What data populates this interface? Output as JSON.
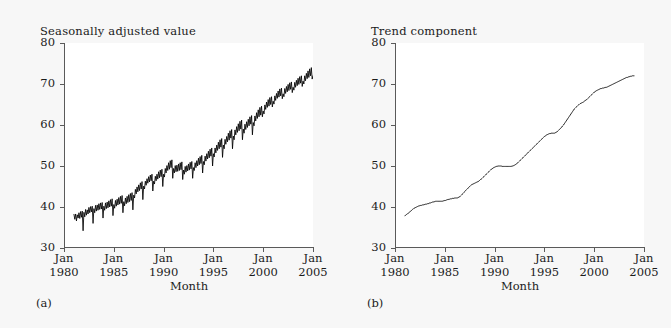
{
  "figure": {
    "background_color": "#f7f7f7",
    "plot_background_color": "#ffffff",
    "line_color": "#000000",
    "axis_color": "#5a5a5a"
  },
  "panels": [
    {
      "key": "a",
      "subfigure_label": "(a)",
      "title": "Seasonally adjusted value",
      "xlabel": "Month",
      "ytick_labels": [
        "80",
        "70",
        "60",
        "50",
        "40",
        "30"
      ],
      "xtick_labels": [
        {
          "month": "Jan",
          "year": "1980"
        },
        {
          "month": "Jan",
          "year": "1985"
        },
        {
          "month": "Jan",
          "year": "1990"
        },
        {
          "month": "Jan",
          "year": "1995"
        },
        {
          "month": "Jan",
          "year": "2000"
        },
        {
          "month": "Jan",
          "year": "2005"
        }
      ]
    },
    {
      "key": "b",
      "subfigure_label": "(b)",
      "title": "Trend component",
      "xlabel": "Month",
      "ytick_labels": [
        "80",
        "70",
        "60",
        "50",
        "40",
        "30"
      ],
      "xtick_labels": [
        {
          "month": "Jan",
          "year": "1980"
        },
        {
          "month": "Jan",
          "year": "1985"
        },
        {
          "month": "Jan",
          "year": "1990"
        },
        {
          "month": "Jan",
          "year": "1995"
        },
        {
          "month": "Jan",
          "year": "2000"
        },
        {
          "month": "Jan",
          "year": "2005"
        }
      ]
    }
  ],
  "chart_data": [
    {
      "type": "line",
      "title": "Seasonally adjusted value",
      "xlabel": "Month",
      "ylabel": "",
      "ylim": [
        30,
        80
      ],
      "yticks": [
        30,
        40,
        50,
        60,
        70,
        80
      ],
      "xlim": [
        "1981-01",
        "2004-01"
      ],
      "xticks": [
        "Jan 1980",
        "Jan 1985",
        "Jan 1990",
        "Jan 1995",
        "Jan 2000",
        "Jan 2005"
      ],
      "grid": false,
      "legend": "none",
      "x_start_year": 1981.0,
      "x_step_years": 0.0833333,
      "values": [
        38.2,
        37.0,
        38.3,
        36.6,
        38.1,
        37.3,
        38.6,
        37.2,
        38.9,
        37.5,
        39.0,
        34.2,
        38.7,
        37.6,
        39.4,
        38.0,
        39.3,
        38.3,
        39.9,
        38.6,
        40.1,
        38.8,
        40.2,
        36.0,
        39.6,
        38.6,
        40.4,
        39.0,
        40.5,
        39.2,
        40.8,
        39.4,
        41.0,
        39.5,
        41.1,
        37.3,
        40.2,
        39.2,
        41.0,
        39.6,
        41.2,
        39.8,
        41.5,
        40.0,
        41.8,
        40.2,
        42.0,
        37.9,
        40.6,
        39.7,
        41.6,
        40.2,
        41.9,
        40.5,
        42.3,
        40.7,
        42.6,
        40.9,
        42.8,
        38.6,
        41.3,
        40.3,
        42.2,
        40.8,
        42.6,
        41.1,
        43.0,
        41.3,
        43.3,
        41.6,
        43.5,
        39.3,
        42.9,
        42.2,
        44.3,
        43.2,
        44.9,
        43.7,
        45.4,
        44.0,
        45.9,
        44.4,
        46.2,
        41.8,
        45.1,
        44.4,
        46.3,
        45.3,
        46.9,
        45.8,
        47.4,
        46.1,
        47.8,
        46.4,
        48.0,
        43.9,
        46.3,
        45.6,
        47.5,
        46.4,
        48.0,
        46.8,
        48.6,
        47.1,
        49.0,
        47.4,
        49.2,
        45.0,
        48.0,
        47.3,
        49.4,
        48.3,
        50.1,
        48.9,
        50.8,
        49.2,
        51.3,
        49.6,
        51.5,
        47.0,
        49.4,
        48.3,
        50.1,
        48.6,
        50.2,
        48.7,
        50.5,
        48.9,
        50.8,
        49.1,
        51.0,
        46.7,
        49.0,
        48.0,
        49.9,
        48.5,
        50.1,
        48.8,
        50.5,
        49.0,
        50.9,
        49.3,
        51.1,
        47.0,
        49.6,
        48.9,
        50.8,
        49.6,
        51.3,
        50.0,
        51.9,
        50.3,
        52.3,
        50.6,
        52.6,
        48.3,
        51.1,
        50.3,
        52.4,
        51.2,
        53.0,
        51.7,
        53.6,
        52.0,
        54.1,
        52.4,
        54.4,
        50.0,
        53.0,
        52.2,
        54.4,
        53.2,
        55.1,
        53.8,
        55.8,
        54.2,
        56.4,
        54.6,
        56.7,
        52.1,
        55.1,
        54.2,
        56.5,
        55.3,
        57.2,
        55.9,
        58.0,
        56.3,
        58.6,
        56.8,
        58.9,
        54.2,
        57.3,
        56.4,
        58.8,
        57.6,
        59.6,
        58.2,
        60.3,
        58.6,
        60.9,
        59.0,
        61.2,
        56.4,
        59.0,
        58.0,
        60.2,
        58.9,
        60.8,
        59.4,
        61.4,
        59.8,
        62.0,
        60.2,
        62.3,
        57.6,
        60.6,
        59.8,
        62.2,
        61.0,
        63.0,
        61.6,
        63.7,
        62.0,
        64.3,
        62.4,
        64.6,
        62.0,
        63.4,
        62.7,
        64.9,
        63.8,
        65.6,
        64.3,
        66.2,
        64.6,
        66.7,
        65.0,
        66.9,
        64.4,
        65.8,
        65.1,
        67.1,
        66.0,
        67.7,
        66.5,
        68.3,
        66.8,
        68.8,
        67.1,
        69.0,
        66.4,
        67.6,
        66.9,
        68.9,
        67.7,
        69.4,
        68.1,
        69.9,
        68.4,
        70.3,
        68.7,
        70.5,
        67.9,
        69.2,
        68.5,
        70.4,
        69.2,
        70.9,
        69.6,
        71.4,
        69.9,
        71.8,
        70.2,
        72.0,
        69.4,
        70.7,
        70.0,
        72.0,
        70.8,
        72.6,
        71.3,
        73.2,
        71.6,
        73.7,
        72.0,
        74.0,
        71.2,
        72.0
      ]
    },
    {
      "type": "line",
      "title": "Trend component",
      "xlabel": "Month",
      "ylabel": "",
      "ylim": [
        30,
        80
      ],
      "yticks": [
        30,
        40,
        50,
        60,
        70,
        80
      ],
      "xlim": [
        "1981-01",
        "2004-01"
      ],
      "xticks": [
        "Jan 1980",
        "Jan 1985",
        "Jan 1990",
        "Jan 1995",
        "Jan 2000",
        "Jan 2005"
      ],
      "grid": false,
      "legend": "none",
      "x_start_year": 1981.0,
      "x_step_years": 0.0833333,
      "values": [
        37.9,
        38.0,
        38.2,
        38.3,
        38.5,
        38.7,
        38.8,
        39.0,
        39.2,
        39.4,
        39.5,
        39.7,
        39.8,
        39.9,
        40.0,
        40.1,
        40.2,
        40.3,
        40.3,
        40.4,
        40.4,
        40.5,
        40.5,
        40.6,
        40.6,
        40.7,
        40.7,
        40.8,
        40.8,
        40.9,
        41.0,
        41.0,
        41.1,
        41.2,
        41.2,
        41.3,
        41.3,
        41.4,
        41.4,
        41.4,
        41.4,
        41.4,
        41.4,
        41.4,
        41.4,
        41.4,
        41.5,
        41.5,
        41.6,
        41.6,
        41.7,
        41.8,
        41.8,
        41.9,
        41.9,
        42.0,
        42.0,
        42.1,
        42.1,
        42.1,
        42.2,
        42.2,
        42.2,
        42.2,
        42.3,
        42.4,
        42.5,
        42.7,
        42.9,
        43.1,
        43.3,
        43.5,
        43.8,
        44.0,
        44.2,
        44.4,
        44.6,
        44.8,
        45.0,
        45.2,
        45.4,
        45.5,
        45.6,
        45.7,
        45.8,
        45.9,
        46.0,
        46.1,
        46.2,
        46.3,
        46.5,
        46.7,
        46.8,
        47.0,
        47.2,
        47.4,
        47.6,
        47.8,
        48.0,
        48.2,
        48.4,
        48.6,
        48.8,
        49.0,
        49.2,
        49.3,
        49.5,
        49.6,
        49.7,
        49.8,
        49.9,
        49.9,
        50.0,
        50.0,
        50.0,
        50.0,
        50.0,
        49.9,
        49.9,
        49.9,
        49.9,
        49.9,
        49.9,
        49.9,
        49.9,
        49.9,
        49.9,
        49.9,
        49.9,
        50.0,
        50.0,
        50.1,
        50.2,
        50.3,
        50.5,
        50.6,
        50.8,
        51.0,
        51.2,
        51.4,
        51.6,
        51.8,
        52.0,
        52.2,
        52.4,
        52.6,
        52.8,
        53.0,
        53.2,
        53.4,
        53.6,
        53.8,
        54.0,
        54.2,
        54.4,
        54.6,
        54.8,
        55.0,
        55.2,
        55.4,
        55.6,
        55.8,
        56.0,
        56.2,
        56.4,
        56.6,
        56.8,
        57.0,
        57.2,
        57.3,
        57.5,
        57.6,
        57.7,
        57.8,
        57.9,
        57.9,
        58.0,
        58.0,
        58.0,
        58.0,
        58.0,
        58.1,
        58.2,
        58.3,
        58.5,
        58.7,
        58.9,
        59.1,
        59.3,
        59.5,
        59.8,
        60.0,
        60.3,
        60.6,
        60.9,
        61.2,
        61.5,
        61.8,
        62.1,
        62.4,
        62.7,
        63.0,
        63.3,
        63.6,
        63.9,
        64.1,
        64.3,
        64.5,
        64.7,
        64.9,
        65.0,
        65.2,
        65.3,
        65.4,
        65.5,
        65.6,
        65.8,
        65.9,
        66.1,
        66.2,
        66.4,
        66.6,
        66.8,
        67.0,
        67.2,
        67.4,
        67.6,
        67.8,
        68.0,
        68.1,
        68.3,
        68.4,
        68.5,
        68.6,
        68.7,
        68.8,
        68.9,
        68.9,
        69.0,
        69.0,
        69.1,
        69.1,
        69.2,
        69.2,
        69.3,
        69.4,
        69.5,
        69.6,
        69.7,
        69.8,
        69.9,
        70.0,
        70.1,
        70.2,
        70.3,
        70.4,
        70.5,
        70.6,
        70.7,
        70.8,
        70.9,
        71.0,
        71.1,
        71.2,
        71.3,
        71.4,
        71.5,
        71.6,
        71.6,
        71.7,
        71.8,
        71.8,
        71.9,
        71.9,
        72.0,
        72.0,
        72.0
      ]
    }
  ]
}
